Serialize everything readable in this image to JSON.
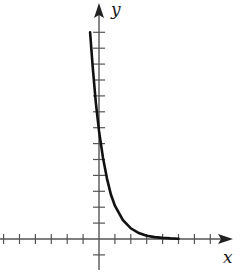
{
  "chart_data": {
    "type": "line",
    "title": "",
    "xlabel": "x",
    "ylabel": "y",
    "grid": false,
    "legend": null,
    "function": "exponential decay y = a·e^(-kx)",
    "x_ticks_left": 6,
    "x_ticks_right": 7,
    "y_ticks_above": 13,
    "y_ticks_below": 1,
    "xlim": [
      -6.2,
      8.4
    ],
    "ylim": [
      -1.9,
      14.9
    ],
    "series": [
      {
        "name": "curve",
        "x": [
          -0.56,
          -0.4,
          -0.2,
          0,
          0.25,
          0.5,
          0.75,
          1,
          1.5,
          2,
          2.5,
          3,
          3.5,
          4,
          4.5,
          5
        ],
        "y": [
          13.0,
          10.9,
          8.6,
          6.8,
          5.1,
          3.8,
          2.8,
          2.1,
          1.2,
          0.67,
          0.38,
          0.21,
          0.12,
          0.07,
          0.04,
          0.02
        ]
      }
    ]
  },
  "axes": {
    "x_label": "x",
    "y_label": "y"
  },
  "colors": {
    "axis": "#555555",
    "curve": "#111111",
    "background": "#ffffff"
  }
}
